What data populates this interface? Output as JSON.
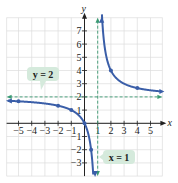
{
  "chart_data": {
    "type": "line",
    "title": "",
    "function": "y = 2x/(x - 1)",
    "xlabel": "x",
    "ylabel": "y",
    "xlim": [
      -5.9,
      5.9
    ],
    "ylim": [
      -4,
      8
    ],
    "grid": true,
    "x_ticks": [
      -5,
      -4,
      -3,
      -2,
      -1,
      1,
      2,
      3,
      4,
      5
    ],
    "y_ticks": [
      -3,
      -2,
      -1,
      1,
      2,
      3,
      4,
      5,
      6,
      7
    ],
    "x_tick_labels": [
      "−5",
      "−4",
      "−3",
      "−2",
      "−1",
      "1",
      "2",
      "3",
      "4",
      "5"
    ],
    "y_tick_labels": [
      "−3",
      "−2",
      "−1",
      "1",
      "2",
      "3",
      "4",
      "5",
      "6",
      "7"
    ],
    "series": [
      {
        "name": "left branch",
        "points": [
          [
            -5,
            1.67
          ],
          [
            -2,
            1.33
          ],
          [
            -1,
            1
          ],
          [
            0,
            0
          ],
          [
            0.5,
            -2
          ]
        ]
      },
      {
        "name": "right branch",
        "points": [
          [
            2,
            4
          ],
          [
            4,
            2.67
          ]
        ]
      }
    ],
    "asymptotes": [
      {
        "type": "horizontal",
        "value": 2,
        "label": "y = 2"
      },
      {
        "type": "vertical",
        "value": 1,
        "label": "x = 1"
      }
    ],
    "colors": {
      "curve": "#3a5ea8",
      "asymptote": "#3a9a72",
      "label_bg": "#d5eadc",
      "grid": "#dcdcdc"
    }
  },
  "labels": {
    "x_axis": "x",
    "y_axis": "y",
    "h_asym": "y = 2",
    "v_asym": "x = 1"
  }
}
